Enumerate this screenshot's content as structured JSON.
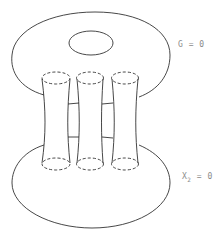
{
  "figure": {
    "stroke_color": "#333333",
    "label_color": "#8a8a8a",
    "upper_surface": {
      "label_main": "G = 0",
      "has_hole": true
    },
    "lower_surface": {
      "label_var": "X",
      "label_sub": "2",
      "label_rest": " = 0"
    },
    "tubes": [
      {
        "name": "tube-1"
      },
      {
        "name": "tube-2"
      },
      {
        "name": "tube-3"
      }
    ],
    "rungs_per_gap": 2
  }
}
